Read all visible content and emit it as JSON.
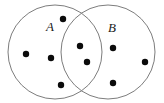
{
  "figure": {
    "name": "venn-diagram-two-sets",
    "width": 164,
    "height": 103,
    "background_color": "#ffffff"
  },
  "chart_data": {
    "type": "diagram",
    "subtype": "venn",
    "title": "",
    "xlabel": "",
    "ylabel": "",
    "grid": false,
    "legend": "none",
    "stroke_color": "#7d7d7d",
    "dot_color": "#0b0b0b",
    "label_color": "#1a1a1a",
    "sets": [
      {
        "id": "A",
        "label": "A",
        "label_x": 50,
        "label_y": 28,
        "cx": 55,
        "cy": 52,
        "r": 47,
        "count_only": 4,
        "count_total": 6
      },
      {
        "id": "B",
        "label": "B",
        "label_x": 112,
        "label_y": 29,
        "cx": 108,
        "cy": 52,
        "r": 47,
        "count_only": 3,
        "count_total": 5
      }
    ],
    "intersection": {
      "label": "A and B",
      "count": 2
    },
    "total_elements": 9,
    "dot_radius": 3.2,
    "points": [
      {
        "id": "p1",
        "x": 26,
        "y": 54,
        "region": "A-only"
      },
      {
        "id": "p2",
        "x": 51,
        "y": 58,
        "region": "A-only"
      },
      {
        "id": "p3",
        "x": 63,
        "y": 19,
        "region": "A-only"
      },
      {
        "id": "p4",
        "x": 61,
        "y": 85,
        "region": "A-only"
      },
      {
        "id": "p5",
        "x": 80,
        "y": 46,
        "region": "A-and-B"
      },
      {
        "id": "p6",
        "x": 87,
        "y": 62,
        "region": "A-and-B"
      },
      {
        "id": "p7",
        "x": 113,
        "y": 48,
        "region": "B-only"
      },
      {
        "id": "p8",
        "x": 145,
        "y": 62,
        "region": "B-only"
      },
      {
        "id": "p9",
        "x": 113,
        "y": 83,
        "region": "B-only"
      }
    ]
  }
}
